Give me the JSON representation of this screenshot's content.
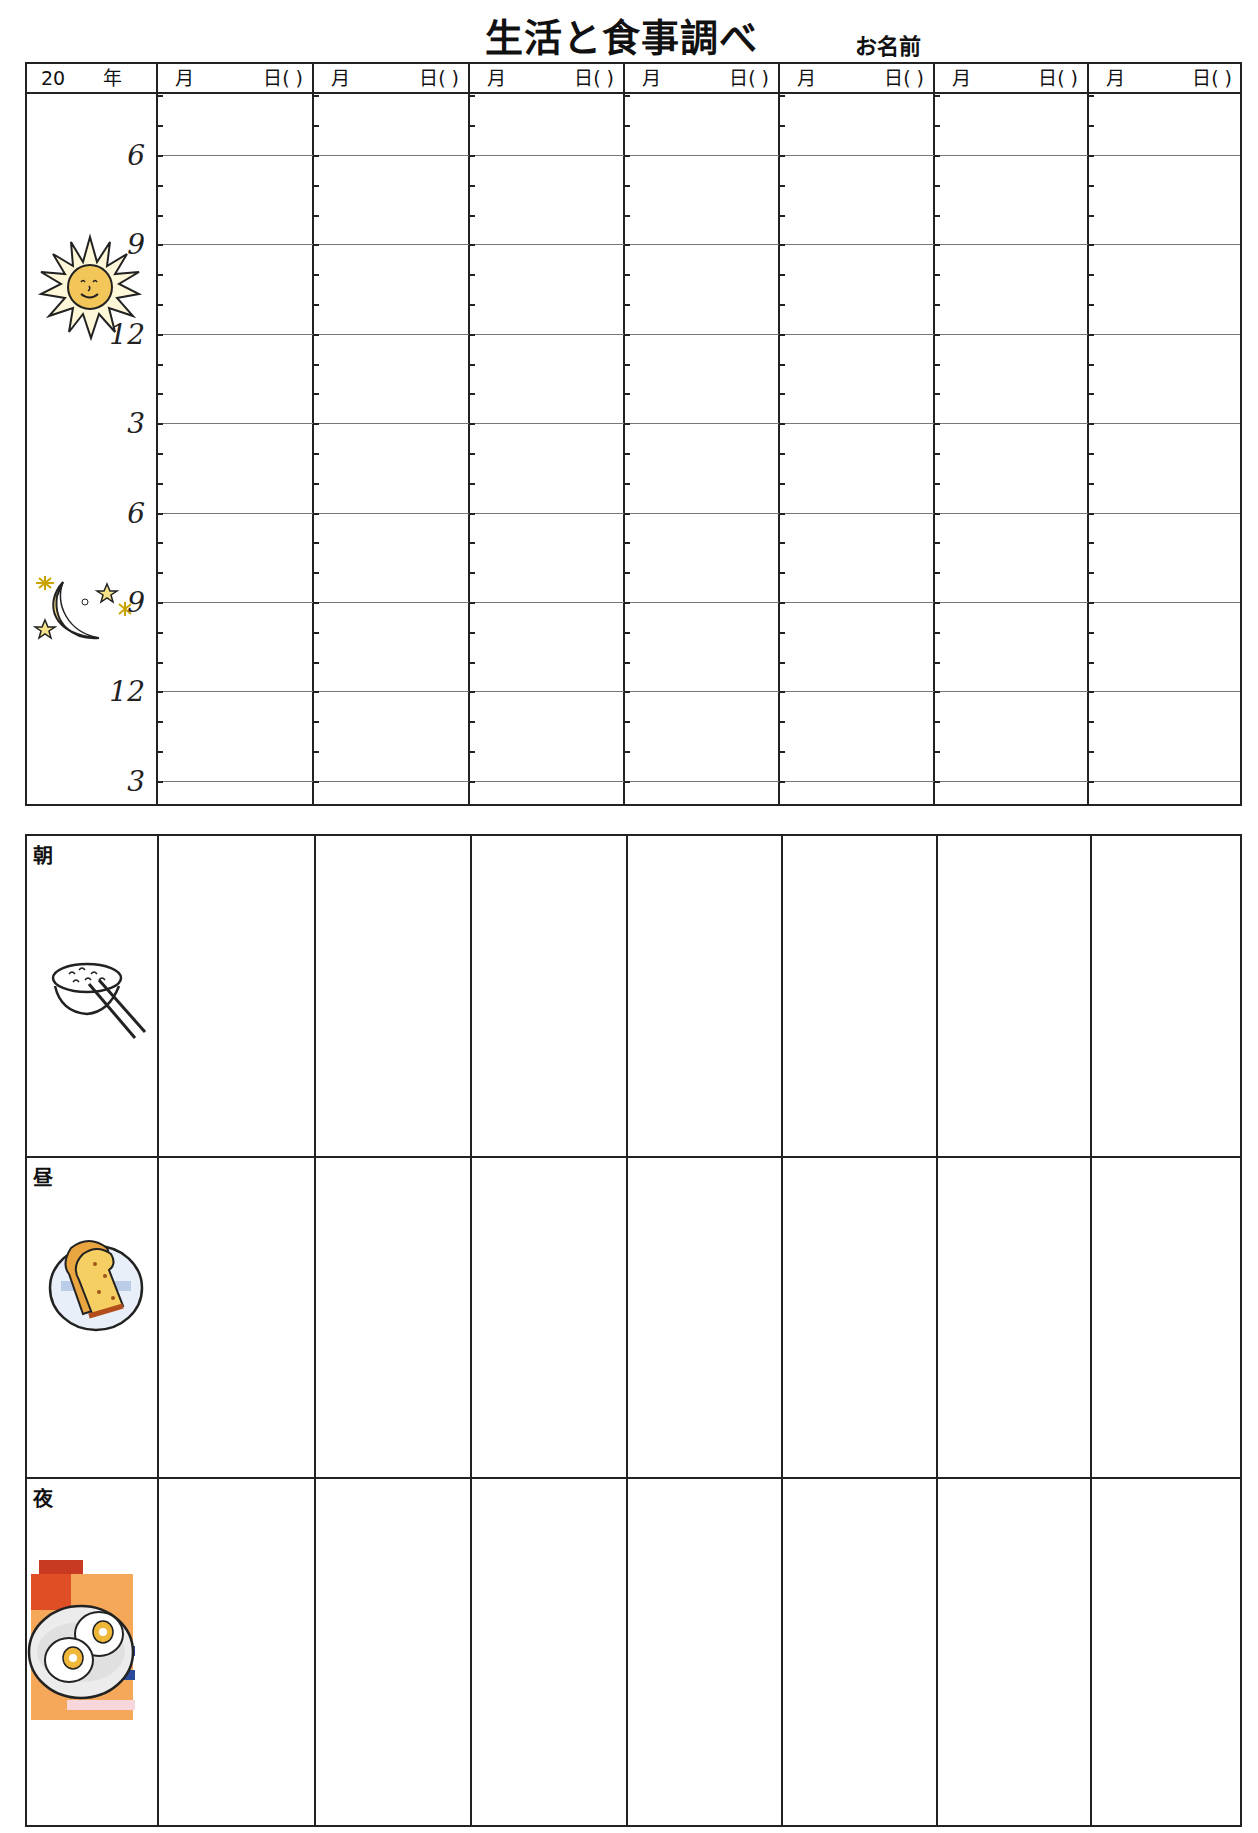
{
  "header": {
    "title": "生活と食事調べ",
    "name_label": "お名前"
  },
  "time_table": {
    "first_header": {
      "year_prefix": "20",
      "year_suffix": "年"
    },
    "day_columns": [
      {
        "month": "月",
        "day": "日(  )"
      },
      {
        "month": "月",
        "day": "日(  )"
      },
      {
        "month": "月",
        "day": "日(  )"
      },
      {
        "month": "月",
        "day": "日(  )"
      },
      {
        "month": "月",
        "day": "日(  )"
      },
      {
        "month": "月",
        "day": "日(  )"
      },
      {
        "month": "月",
        "day": "日(  )"
      }
    ],
    "hour_labels": [
      "6",
      "9",
      "12",
      "3",
      "6",
      "9",
      "12",
      "3"
    ],
    "icons": {
      "day": "sun-icon",
      "night": "moon-stars-icon"
    }
  },
  "meal_table": {
    "rows": [
      {
        "label": "朝",
        "icon": "rice-bowl-chopsticks-icon"
      },
      {
        "label": "昼",
        "icon": "toast-plate-icon"
      },
      {
        "label": "夜",
        "icon": "egg-plate-icon"
      }
    ]
  },
  "colors": {
    "line": "#222222",
    "grid": "#777777",
    "sun": "#f3c65a",
    "moon": "#f5e28a",
    "toast": "#e9a640",
    "dinner_bg": "#f5a85a",
    "dinner_red": "#d64a2a",
    "plate_blue": "#2a4a9a"
  }
}
